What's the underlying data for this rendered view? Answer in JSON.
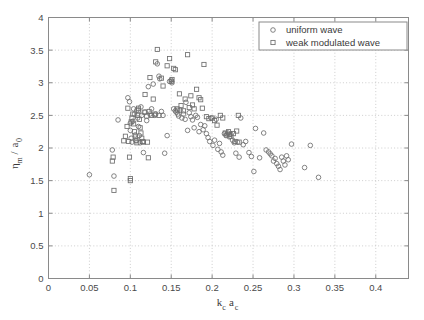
{
  "figure": {
    "background_color": "#ffffff",
    "axis_color": "#8a8a8a",
    "grid_color": "#b8b8b8",
    "marker_color": "#6e6e6e"
  },
  "chart_data": {
    "type": "scatter",
    "title": "",
    "subtitle": "",
    "xlabel": "k_c a_c",
    "xlabel_parts": {
      "main1": "k",
      "sub1": "c",
      "main2": "a",
      "sub2": "c"
    },
    "ylabel": "η_m / a_0",
    "ylabel_parts": {
      "main1": "η",
      "sub1": "m",
      "slash": " / ",
      "main2": "a",
      "sub2": "0"
    },
    "xlim": [
      0,
      0.44
    ],
    "ylim": [
      0,
      4
    ],
    "xticks": [
      0,
      0.05,
      0.1,
      0.15,
      0.2,
      0.25,
      0.3,
      0.35,
      0.4
    ],
    "xticklabels": [
      "0",
      "0.05",
      "0.1",
      "0.15",
      "0.2",
      "0.25",
      "0.3",
      "0.35",
      "0.4"
    ],
    "yticks": [
      0,
      0.5,
      1,
      1.5,
      2,
      2.5,
      3,
      3.5,
      4
    ],
    "yticklabels": [
      "0",
      "0.5",
      "1",
      "1.5",
      "2",
      "2.5",
      "3",
      "3.5",
      "4"
    ],
    "grid": true,
    "grid_style": "dotted",
    "legend_position": "top-right",
    "series": [
      {
        "name": "uniform wave",
        "marker": "circle",
        "marker_size": 4.6,
        "color": "#6e6e6e",
        "points": [
          [
            0.05,
            1.59
          ],
          [
            0.078,
            1.97
          ],
          [
            0.08,
            1.57
          ],
          [
            0.085,
            2.43
          ],
          [
            0.097,
            2.77
          ],
          [
            0.099,
            2.71
          ],
          [
            0.1,
            2.38
          ],
          [
            0.1,
            2.27
          ],
          [
            0.101,
            2.15
          ],
          [
            0.102,
            2.09
          ],
          [
            0.103,
            2.41
          ],
          [
            0.104,
            2.6
          ],
          [
            0.105,
            2.52
          ],
          [
            0.106,
            2.2
          ],
          [
            0.107,
            2.11
          ],
          [
            0.108,
            2.58
          ],
          [
            0.109,
            2.46
          ],
          [
            0.11,
            2.33
          ],
          [
            0.111,
            2.19
          ],
          [
            0.112,
            2.08
          ],
          [
            0.113,
            2.63
          ],
          [
            0.114,
            2.5
          ],
          [
            0.116,
            1.93
          ],
          [
            0.118,
            2.55
          ],
          [
            0.12,
            2.42
          ],
          [
            0.122,
            2.94
          ],
          [
            0.124,
            2.52
          ],
          [
            0.126,
            2.6
          ],
          [
            0.128,
            2.98
          ],
          [
            0.13,
            2.5
          ],
          [
            0.131,
            2.52
          ],
          [
            0.133,
            3.29
          ],
          [
            0.135,
            3.1
          ],
          [
            0.136,
            3.06
          ],
          [
            0.138,
            2.56
          ],
          [
            0.14,
            2.5
          ],
          [
            0.142,
            1.92
          ],
          [
            0.145,
            2.19
          ],
          [
            0.148,
            3.02
          ],
          [
            0.15,
            3.04
          ],
          [
            0.151,
            3.0
          ],
          [
            0.153,
            2.6
          ],
          [
            0.155,
            2.57
          ],
          [
            0.156,
            2.55
          ],
          [
            0.158,
            2.52
          ],
          [
            0.159,
            2.49
          ],
          [
            0.161,
            2.58
          ],
          [
            0.163,
            2.46
          ],
          [
            0.165,
            2.52
          ],
          [
            0.167,
            2.44
          ],
          [
            0.168,
            2.7
          ],
          [
            0.17,
            2.27
          ],
          [
            0.172,
            2.54
          ],
          [
            0.174,
            2.48
          ],
          [
            0.176,
            2.43
          ],
          [
            0.178,
            2.31
          ],
          [
            0.18,
            2.5
          ],
          [
            0.182,
            2.47
          ],
          [
            0.184,
            2.25
          ],
          [
            0.186,
            2.36
          ],
          [
            0.189,
            2.28
          ],
          [
            0.191,
            2.34
          ],
          [
            0.193,
            2.22
          ],
          [
            0.195,
            2.16
          ],
          [
            0.197,
            2.1
          ],
          [
            0.199,
            2.46
          ],
          [
            0.201,
            2.04
          ],
          [
            0.203,
            2.12
          ],
          [
            0.205,
            2.44
          ],
          [
            0.207,
            1.98
          ],
          [
            0.209,
            2.07
          ],
          [
            0.211,
            1.94
          ],
          [
            0.213,
            1.89
          ],
          [
            0.215,
            2.22
          ],
          [
            0.217,
            2.19
          ],
          [
            0.219,
            2.23
          ],
          [
            0.221,
            2.17
          ],
          [
            0.223,
            2.21
          ],
          [
            0.225,
            2.12
          ],
          [
            0.227,
            2.08
          ],
          [
            0.229,
            1.92
          ],
          [
            0.231,
            2.09
          ],
          [
            0.233,
            1.86
          ],
          [
            0.235,
            2.46
          ],
          [
            0.238,
            2.05
          ],
          [
            0.241,
            2.1
          ],
          [
            0.245,
            1.93
          ],
          [
            0.248,
            1.87
          ],
          [
            0.251,
            1.64
          ],
          [
            0.253,
            2.3
          ],
          [
            0.258,
            1.85
          ],
          [
            0.263,
            2.23
          ],
          [
            0.266,
            1.97
          ],
          [
            0.269,
            1.94
          ],
          [
            0.271,
            1.91
          ],
          [
            0.273,
            1.88
          ],
          [
            0.275,
            1.8
          ],
          [
            0.277,
            1.84
          ],
          [
            0.279,
            1.76
          ],
          [
            0.281,
            1.72
          ],
          [
            0.283,
            1.67
          ],
          [
            0.285,
            1.86
          ],
          [
            0.287,
            1.8
          ],
          [
            0.289,
            1.74
          ],
          [
            0.291,
            1.88
          ],
          [
            0.293,
            1.82
          ],
          [
            0.297,
            2.06
          ],
          [
            0.313,
            1.7
          ],
          [
            0.32,
            2.04
          ],
          [
            0.33,
            1.55
          ]
        ]
      },
      {
        "name": "weak modulated wave",
        "marker": "square",
        "marker_size": 4.2,
        "color": "#6e6e6e",
        "points": [
          [
            0.078,
            1.8
          ],
          [
            0.079,
            1.86
          ],
          [
            0.08,
            1.35
          ],
          [
            0.092,
            2.11
          ],
          [
            0.094,
            2.18
          ],
          [
            0.096,
            2.33
          ],
          [
            0.097,
            2.61
          ],
          [
            0.098,
            2.1
          ],
          [
            0.099,
            1.86
          ],
          [
            0.1,
            1.53
          ],
          [
            0.1,
            1.5
          ],
          [
            0.101,
            2.4
          ],
          [
            0.102,
            2.46
          ],
          [
            0.103,
            2.52
          ],
          [
            0.104,
            2.37
          ],
          [
            0.105,
            2.25
          ],
          [
            0.106,
            2.17
          ],
          [
            0.107,
            2.12
          ],
          [
            0.108,
            2.08
          ],
          [
            0.109,
            2.5
          ],
          [
            0.11,
            2.58
          ],
          [
            0.11,
            2.61
          ],
          [
            0.111,
            2.44
          ],
          [
            0.112,
            2.31
          ],
          [
            0.113,
            2.23
          ],
          [
            0.114,
            2.15
          ],
          [
            0.115,
            2.1
          ],
          [
            0.116,
            2.09
          ],
          [
            0.117,
            2.55
          ],
          [
            0.118,
            2.82
          ],
          [
            0.12,
            2.49
          ],
          [
            0.121,
            2.09
          ],
          [
            0.122,
            1.85
          ],
          [
            0.123,
            2.56
          ],
          [
            0.124,
            3.08
          ],
          [
            0.126,
            2.5
          ],
          [
            0.128,
            2.75
          ],
          [
            0.13,
            2.52
          ],
          [
            0.131,
            3.32
          ],
          [
            0.133,
            3.51
          ],
          [
            0.135,
            2.5
          ],
          [
            0.138,
            3.07
          ],
          [
            0.14,
            2.95
          ],
          [
            0.145,
            3.26
          ],
          [
            0.148,
            3.37
          ],
          [
            0.15,
            3.02
          ],
          [
            0.151,
            3.05
          ],
          [
            0.153,
            3.22
          ],
          [
            0.155,
            3.2
          ],
          [
            0.157,
            2.6
          ],
          [
            0.158,
            2.58
          ],
          [
            0.16,
            2.83
          ],
          [
            0.162,
            2.65
          ],
          [
            0.165,
            2.57
          ],
          [
            0.167,
            2.75
          ],
          [
            0.17,
            3.43
          ],
          [
            0.172,
            2.62
          ],
          [
            0.174,
            2.8
          ],
          [
            0.176,
            2.66
          ],
          [
            0.178,
            2.6
          ],
          [
            0.181,
            2.9
          ],
          [
            0.184,
            2.77
          ],
          [
            0.186,
            2.74
          ],
          [
            0.188,
            2.61
          ],
          [
            0.19,
            3.28
          ],
          [
            0.193,
            2.48
          ],
          [
            0.196,
            2.45
          ],
          [
            0.2,
            2.46
          ],
          [
            0.203,
            2.42
          ],
          [
            0.206,
            2.35
          ],
          [
            0.21,
            2.5
          ],
          [
            0.213,
            2.46
          ],
          [
            0.216,
            2.23
          ],
          [
            0.218,
            2.2
          ],
          [
            0.22,
            2.25
          ],
          [
            0.221,
            2.21
          ],
          [
            0.223,
            2.18
          ],
          [
            0.226,
            2.22
          ],
          [
            0.228,
            2.1
          ],
          [
            0.23,
            2.26
          ],
          [
            0.232,
            2.5
          ],
          [
            0.233,
            2.09
          ]
        ]
      }
    ]
  },
  "legend": {
    "entries": [
      {
        "label": "uniform wave",
        "marker": "circle"
      },
      {
        "label": "weak modulated wave",
        "marker": "square"
      }
    ]
  }
}
